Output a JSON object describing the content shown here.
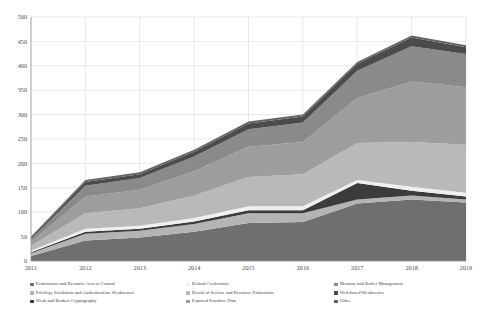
{
  "chart_data": {
    "type": "area",
    "title": "",
    "subtitle": "",
    "xlabel": "",
    "ylabel": "",
    "stacked": true,
    "grid": true,
    "legend_position": "bottom",
    "legend_columns": 3,
    "categories": [
      "2011",
      "2012",
      "2013",
      "2014",
      "2015",
      "2016",
      "2017",
      "2018",
      "2019"
    ],
    "x": [
      2011,
      2012,
      2013,
      2014,
      2015,
      2016,
      2017,
      2018,
      2019
    ],
    "xlim": [
      2011,
      2019
    ],
    "ylim": [
      0,
      500
    ],
    "yticks": [
      0,
      50,
      100,
      150,
      200,
      250,
      300,
      350,
      400,
      450,
      500
    ],
    "xticks": [
      "2011",
      "2012",
      "2013",
      "2014",
      "2015",
      "2016",
      "2017",
      "2018",
      "2019"
    ],
    "series": [
      {
        "name": "Permissions and Resource Access Control",
        "color": "#6f6f6f",
        "values": [
          10,
          42,
          48,
          60,
          78,
          80,
          118,
          126,
          120
        ]
      },
      {
        "name": "Privilege Escalation and Authentication Weaknesses",
        "color": "#b4b4b4",
        "values": [
          6,
          14,
          14,
          16,
          20,
          18,
          8,
          8,
          6
        ]
      },
      {
        "name": "Weak and Broken Cryptography",
        "color": "#3c3c3c",
        "values": [
          2,
          4,
          4,
          5,
          6,
          6,
          34,
          10,
          6
        ]
      },
      {
        "name": "Default Credentials",
        "color": "#efefef",
        "values": [
          3,
          6,
          6,
          7,
          8,
          8,
          6,
          8,
          8
        ]
      },
      {
        "name": "Denial of Service and Resource Exhaustion",
        "color": "#b9b9b9",
        "values": [
          10,
          32,
          36,
          46,
          60,
          66,
          76,
          92,
          98
        ]
      },
      {
        "name": "Exposed Sensitive Data",
        "color": "#9d9d9d",
        "values": [
          8,
          34,
          38,
          50,
          62,
          66,
          92,
          124,
          118
        ]
      },
      {
        "name": "Memory and Buffer Management",
        "color": "#8a8a8a",
        "values": [
          6,
          22,
          24,
          30,
          36,
          40,
          56,
          72,
          68
        ]
      },
      {
        "name": "Web-based Weaknesses",
        "color": "#4b4b4b",
        "values": [
          3,
          8,
          8,
          10,
          12,
          12,
          14,
          18,
          14
        ]
      },
      {
        "name": "Other",
        "color": "#636363",
        "values": [
          2,
          4,
          4,
          4,
          4,
          4,
          4,
          4,
          4
        ]
      }
    ],
    "totals": [
      50,
      166,
      182,
      228,
      286,
      300,
      408,
      462,
      442
    ]
  },
  "legend": {
    "items": [
      {
        "label": "Permissions and Resource Access Control",
        "color": "#6f6f6f"
      },
      {
        "label": "Privilege Escalation and Authentication Weaknesses",
        "color": "#b4b4b4"
      },
      {
        "label": "Weak and Broken Cryptography",
        "color": "#3c3c3c"
      },
      {
        "label": "Default Credentials",
        "color": "#efefef"
      },
      {
        "label": "Denial of Service and Resource Exhaustion",
        "color": "#b9b9b9"
      },
      {
        "label": "Exposed Sensitive Data",
        "color": "#9d9d9d"
      },
      {
        "label": "Memory and Buffer Management",
        "color": "#8a8a8a"
      },
      {
        "label": "Web-based Weaknesses",
        "color": "#4b4b4b"
      },
      {
        "label": "Other",
        "color": "#636363"
      }
    ]
  }
}
